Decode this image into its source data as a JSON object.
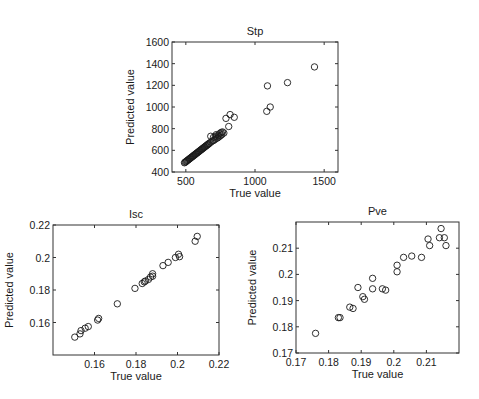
{
  "chart_data": [
    {
      "type": "scatter",
      "title": "Stp",
      "xlabel": "True value",
      "ylabel": "Predicted value",
      "xlim": [
        400,
        1600
      ],
      "ylim": [
        400,
        1600
      ],
      "xticks": [
        500,
        1000,
        1500
      ],
      "yticks": [
        400,
        600,
        800,
        1000,
        1200,
        1400,
        1600
      ],
      "grid": false,
      "frame_px": {
        "left": 172,
        "top": 42,
        "right": 338,
        "bottom": 172
      },
      "points": [
        [
          490,
          485
        ],
        [
          495,
          490
        ],
        [
          500,
          495
        ],
        [
          505,
          500
        ],
        [
          510,
          505
        ],
        [
          515,
          510
        ],
        [
          520,
          515
        ],
        [
          525,
          520
        ],
        [
          530,
          525
        ],
        [
          535,
          530
        ],
        [
          540,
          535
        ],
        [
          545,
          540
        ],
        [
          550,
          545
        ],
        [
          555,
          550
        ],
        [
          560,
          555
        ],
        [
          565,
          560
        ],
        [
          570,
          565
        ],
        [
          575,
          570
        ],
        [
          580,
          575
        ],
        [
          585,
          580
        ],
        [
          590,
          585
        ],
        [
          595,
          590
        ],
        [
          600,
          595
        ],
        [
          605,
          600
        ],
        [
          610,
          605
        ],
        [
          615,
          610
        ],
        [
          620,
          615
        ],
        [
          625,
          620
        ],
        [
          630,
          625
        ],
        [
          635,
          630
        ],
        [
          640,
          635
        ],
        [
          645,
          640
        ],
        [
          650,
          645
        ],
        [
          655,
          650
        ],
        [
          660,
          655
        ],
        [
          665,
          660
        ],
        [
          670,
          665
        ],
        [
          680,
          675
        ],
        [
          690,
          685
        ],
        [
          700,
          690
        ],
        [
          710,
          700
        ],
        [
          720,
          710
        ],
        [
          730,
          715
        ],
        [
          740,
          725
        ],
        [
          750,
          735
        ],
        [
          760,
          745
        ],
        [
          680,
          730
        ],
        [
          700,
          720
        ],
        [
          715,
          730
        ],
        [
          735,
          740
        ],
        [
          745,
          755
        ],
        [
          755,
          765
        ],
        [
          765,
          770
        ],
        [
          775,
          760
        ],
        [
          720,
          745
        ],
        [
          790,
          895
        ],
        [
          810,
          820
        ],
        [
          820,
          930
        ],
        [
          850,
          905
        ],
        [
          1085,
          960
        ],
        [
          1110,
          1000
        ],
        [
          1090,
          1195
        ],
        [
          1235,
          1225
        ],
        [
          1430,
          1370
        ]
      ]
    },
    {
      "type": "scatter",
      "title": "Isc",
      "xlabel": "True value",
      "ylabel": "Predicted value",
      "xlim": [
        0.14,
        0.22
      ],
      "ylim": [
        0.14,
        0.22
      ],
      "xticks": [
        0.16,
        0.18,
        0.2,
        0.22
      ],
      "xticklabels": [
        "0.16",
        "0.18",
        "0.2",
        "0.22"
      ],
      "yticks": [
        0.16,
        0.18,
        0.2,
        0.22
      ],
      "yticklabels": [
        "0.16",
        "0.18",
        "0.2",
        "0.22"
      ],
      "grid": false,
      "frame_px": {
        "left": 53,
        "top": 225,
        "right": 219,
        "bottom": 355
      },
      "points": [
        [
          0.1505,
          0.151
        ],
        [
          0.153,
          0.153
        ],
        [
          0.1535,
          0.155
        ],
        [
          0.1555,
          0.1565
        ],
        [
          0.157,
          0.1575
        ],
        [
          0.1615,
          0.1615
        ],
        [
          0.162,
          0.1625
        ],
        [
          0.171,
          0.1715
        ],
        [
          0.1795,
          0.181
        ],
        [
          0.183,
          0.184
        ],
        [
          0.184,
          0.185
        ],
        [
          0.1845,
          0.1855
        ],
        [
          0.186,
          0.1865
        ],
        [
          0.187,
          0.188
        ],
        [
          0.188,
          0.1885
        ],
        [
          0.188,
          0.19
        ],
        [
          0.193,
          0.195
        ],
        [
          0.1955,
          0.197
        ],
        [
          0.199,
          0.2
        ],
        [
          0.2005,
          0.202
        ],
        [
          0.201,
          0.2005
        ],
        [
          0.2085,
          0.21
        ],
        [
          0.2095,
          0.213
        ]
      ]
    },
    {
      "type": "scatter",
      "title": "Pve",
      "xlabel": "True value",
      "ylabel": "Predicted value",
      "xlim": [
        0.17,
        0.22
      ],
      "ylim": [
        0.17,
        0.22
      ],
      "xticks": [
        0.17,
        0.18,
        0.19,
        0.2,
        0.21
      ],
      "xticklabels": [
        "0.17",
        "0.18",
        "0.19",
        "0.2",
        "0.21"
      ],
      "yticks": [
        0.17,
        0.18,
        0.19,
        0.2,
        0.21
      ],
      "yticklabels": [
        "0.17",
        "0.18",
        "0.19",
        "0.2",
        "0.21"
      ],
      "grid": false,
      "frame_px": {
        "left": 296,
        "top": 222,
        "right": 459,
        "bottom": 353
      },
      "points": [
        [
          0.176,
          0.1775
        ],
        [
          0.183,
          0.1835
        ],
        [
          0.1835,
          0.1835
        ],
        [
          0.1865,
          0.1875
        ],
        [
          0.1875,
          0.187
        ],
        [
          0.189,
          0.195
        ],
        [
          0.1905,
          0.1915
        ],
        [
          0.191,
          0.1905
        ],
        [
          0.1935,
          0.1985
        ],
        [
          0.1935,
          0.1945
        ],
        [
          0.1965,
          0.1945
        ],
        [
          0.1975,
          0.194
        ],
        [
          0.201,
          0.2035
        ],
        [
          0.201,
          0.201
        ],
        [
          0.203,
          0.2065
        ],
        [
          0.2055,
          0.207
        ],
        [
          0.2085,
          0.2065
        ],
        [
          0.2105,
          0.2135
        ],
        [
          0.211,
          0.211
        ],
        [
          0.214,
          0.214
        ],
        [
          0.2145,
          0.2175
        ],
        [
          0.2155,
          0.214
        ],
        [
          0.216,
          0.211
        ]
      ]
    }
  ]
}
